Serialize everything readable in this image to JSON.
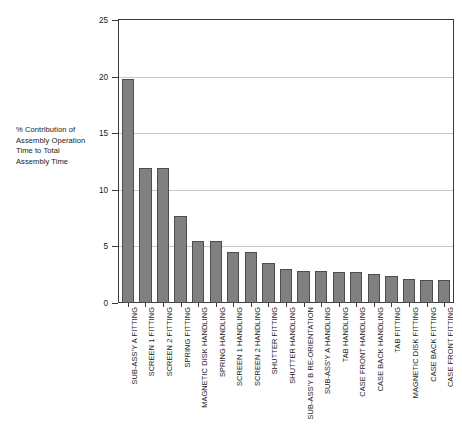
{
  "chart_data": {
    "type": "bar",
    "title": "",
    "subtitle": "",
    "xlabel": "",
    "ylabel": "% Contribution of Assembly Operation Time to Total Assembly Time",
    "ylim": [
      0,
      25
    ],
    "yticks": [
      0,
      5,
      10,
      15,
      20,
      25
    ],
    "ytick_labels": [
      "0",
      "5",
      "10",
      "15",
      "20",
      "25"
    ],
    "grid": true,
    "grid_axis": "y",
    "legend": false,
    "bar_color": "#808080",
    "bar_edge_color": "#4d4d4d",
    "axis_color": "#3a3a3a",
    "gridline_color": "#c8c8c8",
    "categories": [
      "SUB-ASS'Y A FITTING",
      "SCREEN 1 FITTING",
      "SCREEN 2 FITTING",
      "SPRING FITTING",
      "MAGNETIC DISK HANDLING",
      "SPRING HANDLING",
      "SCREEN 1 HANDLING",
      "SCREEN 2 HANDLING",
      "SHUTTER FITTING",
      "SHUTTER HANDLING",
      "SUB-ASS'Y B RE-ORIENTATION",
      "SUB-ASS'Y A HANDLING",
      "TAB HANDLING",
      "CASE FRONT HANDLING",
      "CASE BACK HANDLING",
      "TAB FITTING",
      "MAGNETIC DISK FITTING",
      "CASE BACK FITTING",
      "CASE FRONT FITTING"
    ],
    "values": [
      19.8,
      11.9,
      11.9,
      7.7,
      5.5,
      5.5,
      4.5,
      4.5,
      3.5,
      3.0,
      2.8,
      2.8,
      2.7,
      2.7,
      2.6,
      2.4,
      2.1,
      2.0,
      2.0
    ]
  },
  "y_axis_caption": "% Contribution of\nAssembly Operation\nTime to Total\nAssembly Time"
}
